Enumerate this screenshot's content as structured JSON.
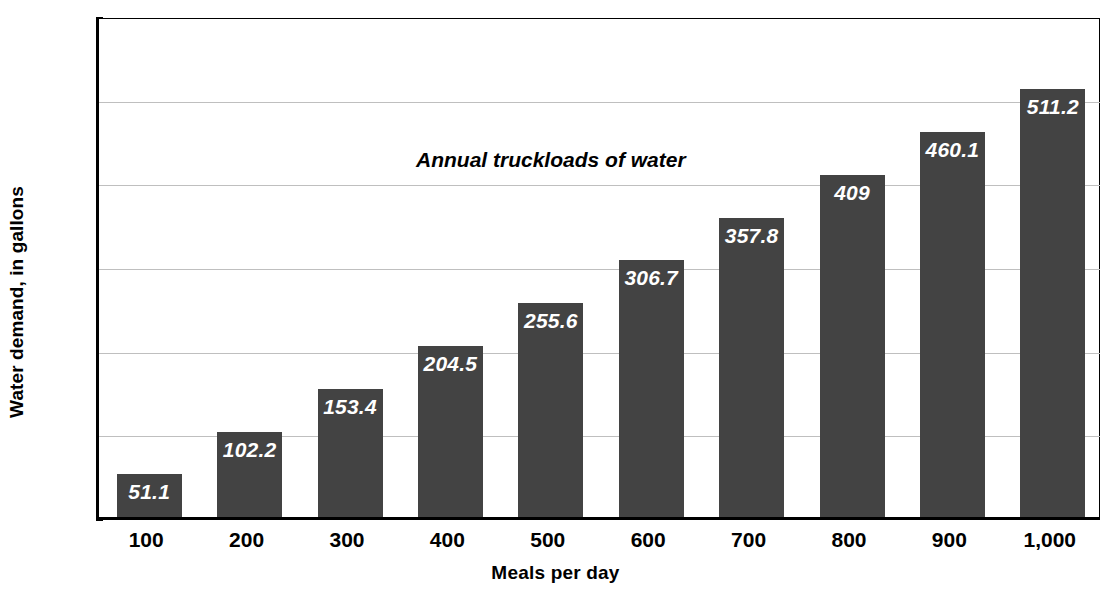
{
  "chart_data": {
    "type": "bar",
    "title": "",
    "xlabel": "Meals per day",
    "ylabel": "Water demand, in gallons",
    "categories": [
      "100",
      "200",
      "300",
      "400",
      "500",
      "600",
      "700",
      "800",
      "900",
      "1,000"
    ],
    "values": [
      51.1,
      102.2,
      153.4,
      204.5,
      255.6,
      306.7,
      357.8,
      409,
      460.1,
      511.2
    ],
    "value_labels": [
      "51.1",
      "102.2",
      "153.4",
      "204.5",
      "255.6",
      "306.7",
      "357.8",
      "409",
      "460.1",
      "511.2"
    ],
    "ylim": [
      0,
      600
    ],
    "yticks": [
      0,
      100,
      200,
      300,
      400,
      500,
      600
    ],
    "ytick_labels": [
      "0",
      "100",
      "200",
      "300",
      "400",
      "500",
      "600"
    ],
    "grid": true,
    "grid_axis": "y",
    "legend": false,
    "annotations": [
      {
        "text": "Annual truckloads of water",
        "x_category": "500",
        "y_value": 430
      }
    ],
    "series": [
      {
        "name": "Water demand",
        "values": [
          51.1,
          102.2,
          153.4,
          204.5,
          255.6,
          306.7,
          357.8,
          409,
          460.1,
          511.2
        ],
        "color": "#434343"
      }
    ],
    "colors": {
      "bar": "#434343",
      "value_label": "#ffffff",
      "axis": "#000000",
      "gridline": "#bfbfbf",
      "background": "#ffffff"
    }
  },
  "axes": {
    "y_title": "Water demand, in gallons",
    "x_title": "Meals per day"
  },
  "caption": {
    "bottom_faint": ""
  }
}
